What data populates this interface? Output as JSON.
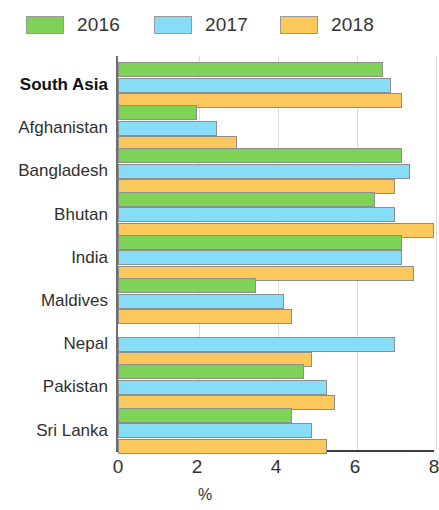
{
  "legend": {
    "items": [
      {
        "label": "2016",
        "color": "#7DD257",
        "swatch_name": "legend-swatch-2016"
      },
      {
        "label": "2017",
        "color": "#86DDF5",
        "swatch_name": "legend-swatch-2017"
      },
      {
        "label": "2018",
        "color": "#FBC95B",
        "swatch_name": "legend-swatch-2018"
      }
    ]
  },
  "axis": {
    "x_title": "%",
    "x_ticks": [
      "0",
      "2",
      "4",
      "6",
      "8"
    ]
  },
  "categories": [
    {
      "label": "South Asia",
      "emphasis": "bold"
    },
    {
      "label": "Afghanistan",
      "emphasis": "normal"
    },
    {
      "label": "Bangladesh",
      "emphasis": "normal"
    },
    {
      "label": "Bhutan",
      "emphasis": "normal"
    },
    {
      "label": "India",
      "emphasis": "normal"
    },
    {
      "label": "Maldives",
      "emphasis": "normal"
    },
    {
      "label": "Nepal",
      "emphasis": "normal"
    },
    {
      "label": "Pakistan",
      "emphasis": "normal"
    },
    {
      "label": "Sri Lanka",
      "emphasis": "normal"
    }
  ],
  "chart_data": {
    "type": "bar",
    "orientation": "horizontal",
    "title": "",
    "subtitle": "",
    "xlabel": "%",
    "ylabel": "",
    "xlim": [
      0,
      8
    ],
    "xticks": [
      0,
      2,
      4,
      6,
      8
    ],
    "grid": true,
    "legend_position": "top",
    "categories": [
      "South Asia",
      "Afghanistan",
      "Bangladesh",
      "Bhutan",
      "India",
      "Maldives",
      "Nepal",
      "Pakistan",
      "Sri Lanka"
    ],
    "series": [
      {
        "name": "2016",
        "color": "#7DD257",
        "values": [
          6.7,
          2.0,
          7.2,
          6.5,
          7.2,
          3.5,
          null,
          4.7,
          4.4
        ]
      },
      {
        "name": "2017",
        "color": "#86DDF5",
        "values": [
          6.9,
          2.5,
          7.4,
          7.0,
          7.2,
          4.2,
          7.0,
          5.3,
          4.9
        ]
      },
      {
        "name": "2018",
        "color": "#FBC95B",
        "values": [
          7.2,
          3.0,
          7.0,
          8.0,
          7.5,
          4.4,
          4.9,
          5.5,
          5.3
        ]
      }
    ]
  }
}
